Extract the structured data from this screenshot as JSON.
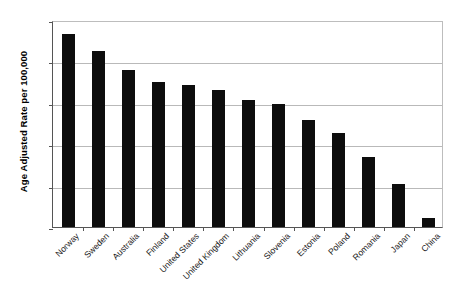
{
  "chart_data": {
    "type": "bar",
    "title": "",
    "subtitle": "",
    "xlabel": "",
    "ylabel": "Age Adjusted Rate per 100,000",
    "ylim": [
      0,
      25
    ],
    "ytick_step": 5,
    "yticks": [
      "0",
      "5",
      "10",
      "15",
      "20",
      "25"
    ],
    "grid": true,
    "legend": false,
    "legend_position": "none",
    "bar_color": "#0d0d0d",
    "categories": [
      "Norway",
      "Sweden",
      "Australia",
      "Finland",
      "United States",
      "United Kingdom",
      "Lithuania",
      "Slovenia",
      "Estonia",
      "Poland",
      "Romania",
      "Japan",
      "China"
    ],
    "values": [
      23.3,
      21.3,
      19.0,
      17.5,
      17.1,
      16.6,
      15.3,
      14.8,
      12.9,
      11.3,
      8.4,
      5.2,
      1.1
    ]
  }
}
